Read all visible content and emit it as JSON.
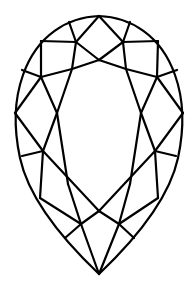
{
  "figure": {
    "title": "Pear-shaped diamond facet diagram",
    "stroke_color": "#000000",
    "background": "#ffffff",
    "stroke_width": 2.2,
    "outline": "M99,16 C130,17 161,35 175,75 C184,100 184,130 178,158 C170,195 140,235 99,274 C58,235 28,195 20,158 C14,130 14,100 23,75 C37,35 68,17 99,16 Z",
    "facet_lines": [
      [
        99,
        16,
        76,
        42
      ],
      [
        99,
        16,
        123,
        42
      ],
      [
        69,
        22,
        76,
        42
      ],
      [
        130,
        22,
        123,
        42
      ],
      [
        41,
        41,
        76,
        42
      ],
      [
        158,
        41,
        123,
        42
      ],
      [
        76,
        42,
        99,
        60
      ],
      [
        123,
        42,
        99,
        60
      ],
      [
        41,
        41,
        41,
        77
      ],
      [
        158,
        41,
        157,
        77
      ],
      [
        76,
        42,
        72,
        69
      ],
      [
        123,
        42,
        126,
        69
      ],
      [
        99,
        60,
        72,
        69
      ],
      [
        99,
        60,
        126,
        69
      ],
      [
        72,
        69,
        41,
        77
      ],
      [
        126,
        69,
        157,
        77
      ],
      [
        22,
        70,
        41,
        77
      ],
      [
        177,
        70,
        157,
        77
      ],
      [
        41,
        77,
        15,
        113
      ],
      [
        157,
        77,
        183,
        113
      ],
      [
        41,
        77,
        57,
        113
      ],
      [
        157,
        77,
        141,
        113
      ],
      [
        72,
        69,
        57,
        113
      ],
      [
        126,
        69,
        141,
        113
      ],
      [
        15,
        113,
        43,
        151
      ],
      [
        183,
        113,
        155,
        151
      ],
      [
        57,
        113,
        43,
        151
      ],
      [
        141,
        113,
        155,
        151
      ],
      [
        57,
        113,
        68,
        184
      ],
      [
        141,
        113,
        130,
        184
      ],
      [
        22,
        156,
        43,
        151
      ],
      [
        176,
        156,
        155,
        151
      ],
      [
        43,
        151,
        99,
        211
      ],
      [
        155,
        151,
        99,
        211
      ],
      [
        43,
        151,
        40,
        198
      ],
      [
        155,
        151,
        158,
        198
      ],
      [
        40,
        198,
        81,
        224
      ],
      [
        158,
        198,
        119,
        224
      ],
      [
        68,
        184,
        81,
        224
      ],
      [
        130,
        184,
        119,
        224
      ],
      [
        99,
        211,
        81,
        224
      ],
      [
        99,
        211,
        119,
        224
      ],
      [
        81,
        224,
        65,
        238
      ],
      [
        119,
        224,
        134,
        238
      ],
      [
        81,
        224,
        99,
        274
      ],
      [
        119,
        224,
        99,
        274
      ]
    ]
  }
}
